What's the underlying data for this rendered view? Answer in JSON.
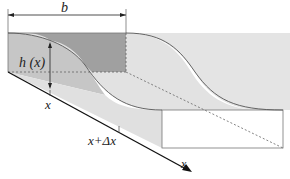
{
  "diagram": {
    "type": "3d-channel-profile",
    "labels": {
      "width": "b",
      "height": "h (x)",
      "position": "x",
      "position_plus_delta": "x+Δx",
      "axis": "x"
    },
    "colors": {
      "dark_fill": "#9e9e9e",
      "mid_fill": "#c4c4c4",
      "light_fill": "#e2e2e2",
      "line": "#555555",
      "axis": "#111111"
    }
  }
}
